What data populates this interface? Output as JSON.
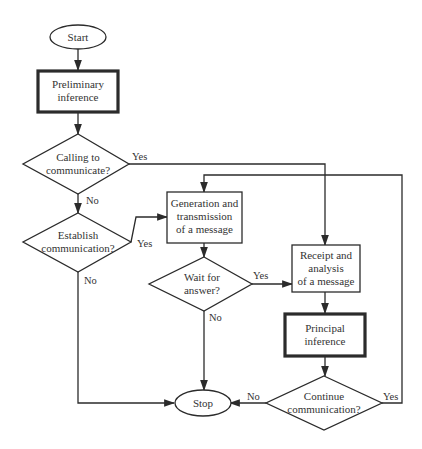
{
  "diagram": {
    "type": "flowchart",
    "colors": {
      "stroke": "#2b2b2b",
      "text": "#333333",
      "background": "#ffffff"
    },
    "nodes": {
      "start": {
        "shape": "oval",
        "lines": [
          "Start"
        ]
      },
      "prelim": {
        "shape": "box-bold",
        "lines": [
          "Preliminary",
          "inference"
        ]
      },
      "calling": {
        "shape": "diamond",
        "lines": [
          "Calling to",
          "communicate?"
        ]
      },
      "establish": {
        "shape": "diamond",
        "lines": [
          "Establish",
          "communication?"
        ]
      },
      "generation": {
        "shape": "box",
        "lines": [
          "Generation and",
          "transmission",
          "of a message"
        ]
      },
      "wait": {
        "shape": "diamond",
        "lines": [
          "Wait for",
          "answer?"
        ]
      },
      "receipt": {
        "shape": "box",
        "lines": [
          "Receipt and",
          "analysis",
          "of a message"
        ]
      },
      "principal": {
        "shape": "box-bold",
        "lines": [
          "Principal",
          "inference"
        ]
      },
      "continue": {
        "shape": "diamond",
        "lines": [
          "Continue",
          "communication?"
        ]
      },
      "stop": {
        "shape": "oval",
        "lines": [
          "Stop"
        ]
      }
    },
    "edges": [
      {
        "from": "start",
        "to": "prelim",
        "label": ""
      },
      {
        "from": "prelim",
        "to": "calling",
        "label": ""
      },
      {
        "from": "calling",
        "to": "receipt",
        "label": "Yes"
      },
      {
        "from": "calling",
        "to": "establish",
        "label": "No"
      },
      {
        "from": "establish",
        "to": "generation",
        "label": "Yes"
      },
      {
        "from": "establish",
        "to": "stop",
        "label": "No"
      },
      {
        "from": "generation",
        "to": "wait",
        "label": ""
      },
      {
        "from": "wait",
        "to": "receipt",
        "label": "Yes"
      },
      {
        "from": "wait",
        "to": "stop",
        "label": "No"
      },
      {
        "from": "receipt",
        "to": "principal",
        "label": ""
      },
      {
        "from": "principal",
        "to": "continue",
        "label": ""
      },
      {
        "from": "continue",
        "to": "stop",
        "label": "No"
      },
      {
        "from": "continue",
        "to": "generation",
        "label": "Yes"
      }
    ],
    "labels": {
      "yes": "Yes",
      "no": "No"
    }
  }
}
